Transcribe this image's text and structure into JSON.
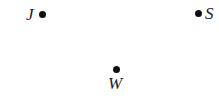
{
  "diagram": {
    "points": [
      {
        "id": "J",
        "label": "J"
      },
      {
        "id": "S",
        "label": "S"
      },
      {
        "id": "W",
        "label": "W"
      }
    ],
    "colors": {
      "dot": "#111111",
      "label": "#222222",
      "background": "#ffffff"
    }
  }
}
